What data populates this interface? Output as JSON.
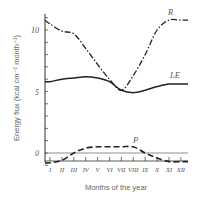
{
  "chart_data": {
    "type": "line",
    "title": "",
    "xlabel": "Months of the year",
    "ylabel": "Energy flux (kcal cm⁻² month⁻¹)",
    "categories": [
      "I",
      "II",
      "III",
      "IV",
      "V",
      "VI",
      "VII",
      "VIII",
      "IX",
      "X",
      "XI",
      "XII"
    ],
    "yticks": [
      0,
      5,
      10
    ],
    "ylim": [
      -1,
      11
    ],
    "grid": false,
    "legend": "inline labels",
    "series": [
      {
        "name": "R",
        "style": "dash-dot",
        "values": [
          10.5,
          9.9,
          9.7,
          8.5,
          7.2,
          6.0,
          5.1,
          6.3,
          8.0,
          10.0,
          10.8,
          10.8
        ]
      },
      {
        "name": "LE",
        "style": "solid",
        "values": [
          5.8,
          6.0,
          6.1,
          6.2,
          6.1,
          5.8,
          5.1,
          4.9,
          5.1,
          5.4,
          5.6,
          5.6
        ]
      },
      {
        "name": "P",
        "style": "dashed",
        "values": [
          -0.8,
          -0.6,
          0.0,
          0.4,
          0.5,
          0.5,
          0.5,
          0.5,
          0.0,
          -0.4,
          -0.7,
          -0.7
        ]
      }
    ]
  },
  "labels": {
    "xlabel": "Months of the year",
    "ylabel": "Energy flux (kcal cm⁻² month⁻¹)",
    "series_R": "R",
    "series_LE": "LE",
    "series_P": "P"
  }
}
